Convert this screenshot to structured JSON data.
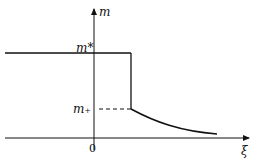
{
  "diagram": {
    "y_axis_label": "m",
    "x_axis_label": "ξ",
    "origin_label": "0",
    "upper_level_label": "m*",
    "lower_level_label": "m₊"
  },
  "colors": {
    "ink": "#111111",
    "background": "#ffffff"
  }
}
